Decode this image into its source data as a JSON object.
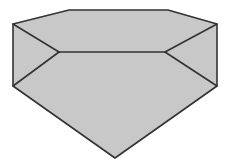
{
  "figure": {
    "colors": {
      "fill": "#c8c8c8",
      "stroke": "#333333",
      "background": "#ffffff"
    },
    "stroke_width": 1.6,
    "vertices": {
      "back_left": [
        69,
        10
      ],
      "back_right": [
        168,
        10
      ],
      "outer_left_top": [
        13,
        24
      ],
      "outer_right_top": [
        217,
        24
      ],
      "inner_left": [
        59,
        52
      ],
      "inner_right": [
        165,
        52
      ],
      "outer_left_bottom": [
        13,
        86
      ],
      "outer_right_bottom": [
        217,
        86
      ],
      "apex_bottom": [
        115,
        158
      ]
    }
  }
}
